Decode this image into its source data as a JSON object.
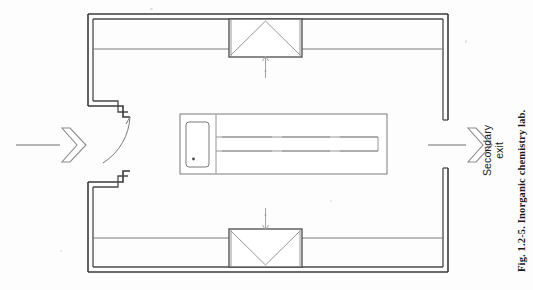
{
  "figure": {
    "caption_prefix": "Fig. 1.2-5.",
    "caption_text": " Inorganic chemistry lab.",
    "caption_full": "Fig. 1.2-5. Inorganic chemistry lab."
  },
  "labels": {
    "secondary_exit_line1": "Secondary",
    "secondary_exit_line2": "exit"
  },
  "plan": {
    "title": "Inorganic chemistry lab floor plan",
    "room_name": "inorganic-chemistry-laboratory",
    "wall_style": "double-line",
    "entrance_side": "left",
    "exit_side": "right",
    "fume_hood_count": 2,
    "island_bench_count": 1
  },
  "elements": {
    "outer_wall": "outer-wall",
    "inner_wall": "inner-wall",
    "top_bench": "top-perimeter-bench",
    "bottom_bench": "bottom-perimeter-bench",
    "top_hood": "top-fume-hood",
    "bottom_hood": "bottom-fume-hood",
    "top_hood_arrow": "airflow-arrow-up",
    "bottom_hood_arrow": "airflow-arrow-down",
    "entry_door": "entry-door",
    "door_swing": "door-swing-arc",
    "entry_arrow": "entrance-direction-arrow",
    "exit_arrow": "exit-direction-arrow",
    "exit_gap": "secondary-exit-opening",
    "island": "island-bench",
    "island_sink": "island-sink-unit",
    "island_sink_drain": "island-sink-drain",
    "island_channel": "island-service-channel"
  },
  "colors": {
    "line": "#3a3a3a",
    "line_light": "#8a8a8a",
    "paper": "#fdfdfd",
    "text": "#1a1a1a"
  }
}
